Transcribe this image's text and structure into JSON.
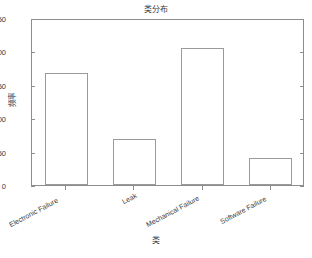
{
  "chart_data": {
    "type": "bar",
    "title": "类分布",
    "xlabel": "类",
    "ylabel": "频率",
    "categories": [
      "Electronic Failure",
      "Leak",
      "Mechanical Failure",
      "Software Failure"
    ],
    "values": [
      168,
      69,
      205,
      41
    ],
    "ylim": [
      0,
      250
    ],
    "yticks": [
      0,
      50,
      100,
      150,
      200,
      250
    ],
    "ytick_labels": [
      "0",
      "50",
      "100",
      "150",
      "200",
      "250"
    ],
    "grid": false,
    "legend": null,
    "bar_face_color": "#ffffff",
    "bar_edge_color": "#9a9a9a",
    "axes_color": "#8d8d8d",
    "text_color": "#3a3a3a",
    "background": "#ffffff"
  }
}
